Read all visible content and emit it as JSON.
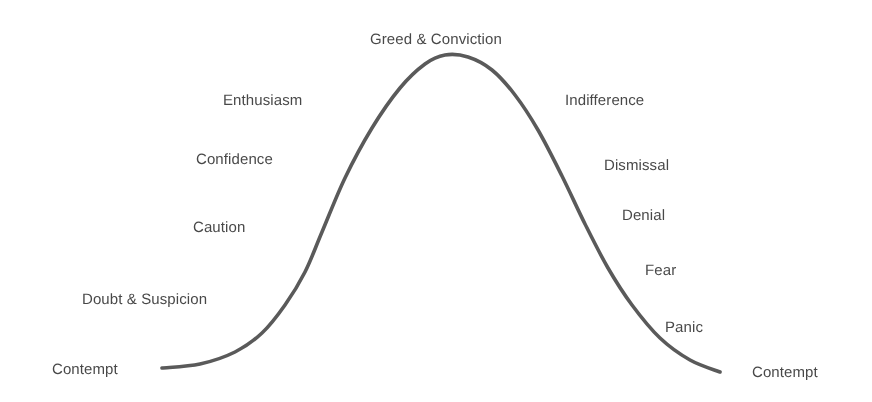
{
  "figure": {
    "background_color": "#ffffff",
    "curve_color": "#5a5a5a",
    "label_color": "#3b3b3b"
  },
  "chart_data": {
    "type": "line",
    "title": "",
    "xlabel": "",
    "ylabel": "",
    "grid": false,
    "legend": "none",
    "xlim": [
      0,
      872
    ],
    "ylim": [
      402,
      0
    ],
    "series": [
      {
        "name": "sentiment-curve",
        "color": "#5a5a5a",
        "linewidth": 3.6,
        "x": [
          162,
          200,
          235,
          262,
          285,
          305,
          322,
          345,
          372,
          400,
          425,
          445,
          468,
          492,
          515,
          538,
          562,
          585,
          608,
          632,
          660,
          690,
          720
        ],
        "y": [
          368,
          364,
          352,
          333,
          305,
          272,
          232,
          178,
          128,
          88,
          64,
          55,
          57,
          70,
          95,
          130,
          176,
          224,
          268,
          305,
          338,
          360,
          372
        ]
      }
    ],
    "annotations": [
      {
        "text": "Contempt",
        "x": 52,
        "y": 362,
        "anchor": "start",
        "phase": "left-trough",
        "stage": 1
      },
      {
        "text": "Doubt & Suspicion",
        "x": 82,
        "y": 292,
        "anchor": "start",
        "phase": "left-rise",
        "stage": 2
      },
      {
        "text": "Caution",
        "x": 193,
        "y": 220,
        "anchor": "start",
        "phase": "left-rise",
        "stage": 3
      },
      {
        "text": "Confidence",
        "x": 196,
        "y": 152,
        "anchor": "start",
        "phase": "left-rise",
        "stage": 4
      },
      {
        "text": "Enthusiasm",
        "x": 223,
        "y": 93,
        "anchor": "start",
        "phase": "left-rise",
        "stage": 5
      },
      {
        "text": "Greed & Conviction",
        "x": 370,
        "y": 32,
        "anchor": "start",
        "phase": "peak",
        "stage": 6
      },
      {
        "text": "Indifference",
        "x": 565,
        "y": 93,
        "anchor": "start",
        "phase": "right-fall",
        "stage": 7
      },
      {
        "text": "Dismissal",
        "x": 604,
        "y": 158,
        "anchor": "start",
        "phase": "right-fall",
        "stage": 8
      },
      {
        "text": "Denial",
        "x": 622,
        "y": 208,
        "anchor": "start",
        "phase": "right-fall",
        "stage": 9
      },
      {
        "text": "Fear",
        "x": 645,
        "y": 263,
        "anchor": "start",
        "phase": "right-fall",
        "stage": 10
      },
      {
        "text": "Panic",
        "x": 665,
        "y": 320,
        "anchor": "start",
        "phase": "right-fall",
        "stage": 11
      },
      {
        "text": "Contempt",
        "x": 752,
        "y": 365,
        "anchor": "start",
        "phase": "right-trough",
        "stage": 12
      }
    ]
  }
}
